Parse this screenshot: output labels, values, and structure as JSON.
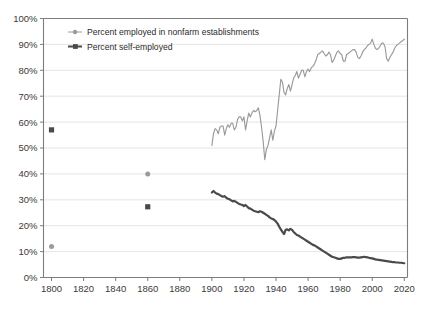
{
  "chart_data": {
    "type": "line",
    "title": "",
    "xlabel": "",
    "ylabel": "",
    "xlim": [
      1795,
      2022
    ],
    "ylim": [
      0,
      100
    ],
    "grid": true,
    "legend_position": "top-left-inside",
    "y_tick_labels": [
      "0%",
      "10%",
      "20%",
      "30%",
      "40%",
      "50%",
      "60%",
      "70%",
      "80%",
      "90%",
      "100%"
    ],
    "y_ticks": [
      0,
      10,
      20,
      30,
      40,
      50,
      60,
      70,
      80,
      90,
      100
    ],
    "x_tick_labels": [
      "1800",
      "1820",
      "1840",
      "1860",
      "1880",
      "1900",
      "1920",
      "1940",
      "1960",
      "1980",
      "2000",
      "2020"
    ],
    "x_ticks": [
      1800,
      1820,
      1840,
      1860,
      1880,
      1900,
      1920,
      1940,
      1960,
      1980,
      2000,
      2020
    ],
    "colors": {
      "nonfarm": "#9a9a9a",
      "self_employed": "#4a4a4a",
      "grid": "#dedede",
      "axis": "#7d7d7d",
      "text": "#3a3a3a"
    },
    "series": [
      {
        "name": "Percent employed in nonfarm establishments",
        "color": "#9a9a9a",
        "marker": "circle",
        "isolated_points": [
          {
            "x": 1800,
            "y": 12.0
          },
          {
            "x": 1860,
            "y": 40.0
          }
        ],
        "x": [
          1900,
          1901,
          1902,
          1903,
          1904,
          1905,
          1906,
          1907,
          1908,
          1909,
          1910,
          1911,
          1912,
          1913,
          1914,
          1915,
          1916,
          1917,
          1918,
          1919,
          1920,
          1921,
          1922,
          1923,
          1924,
          1925,
          1926,
          1927,
          1928,
          1929,
          1930,
          1931,
          1932,
          1933,
          1934,
          1935,
          1936,
          1937,
          1938,
          1939,
          1940,
          1941,
          1942,
          1943,
          1944,
          1945,
          1946,
          1947,
          1948,
          1949,
          1950,
          1951,
          1952,
          1953,
          1954,
          1955,
          1956,
          1957,
          1958,
          1959,
          1960,
          1961,
          1962,
          1963,
          1964,
          1965,
          1966,
          1967,
          1968,
          1969,
          1970,
          1971,
          1972,
          1973,
          1974,
          1975,
          1976,
          1977,
          1978,
          1979,
          1980,
          1981,
          1982,
          1983,
          1984,
          1985,
          1986,
          1987,
          1988,
          1989,
          1990,
          1991,
          1992,
          1993,
          1994,
          1995,
          1996,
          1997,
          1998,
          1999,
          2000,
          2001,
          2002,
          2003,
          2004,
          2005,
          2006,
          2007,
          2008,
          2009,
          2010,
          2011,
          2012,
          2013,
          2014,
          2015,
          2016,
          2017,
          2018,
          2019,
          2020
        ],
        "values": [
          51.0,
          55.5,
          57.5,
          57.0,
          55.5,
          58.0,
          58.5,
          58.5,
          55.0,
          57.5,
          59.0,
          58.0,
          59.5,
          59.5,
          57.0,
          58.0,
          61.0,
          62.0,
          62.0,
          60.5,
          62.0,
          57.0,
          60.5,
          63.5,
          62.0,
          63.5,
          64.5,
          64.0,
          64.5,
          65.5,
          62.5,
          58.0,
          52.5,
          45.5,
          49.5,
          51.0,
          54.0,
          57.0,
          53.0,
          56.5,
          58.5,
          64.5,
          70.5,
          76.5,
          75.5,
          71.5,
          70.5,
          73.0,
          74.5,
          72.0,
          74.5,
          77.0,
          78.0,
          79.5,
          77.0,
          78.5,
          80.0,
          80.0,
          77.5,
          79.5,
          80.5,
          79.5,
          81.0,
          81.5,
          82.5,
          84.0,
          86.0,
          86.5,
          87.0,
          87.5,
          86.5,
          85.5,
          86.0,
          87.0,
          86.0,
          83.0,
          84.0,
          85.5,
          87.0,
          87.5,
          86.5,
          86.0,
          83.5,
          83.5,
          86.0,
          86.5,
          87.0,
          87.5,
          88.0,
          88.0,
          87.0,
          85.0,
          84.5,
          85.5,
          87.0,
          88.0,
          88.5,
          89.5,
          90.0,
          90.5,
          92.0,
          90.0,
          88.5,
          88.0,
          88.5,
          89.5,
          90.5,
          90.5,
          89.0,
          84.5,
          83.5,
          85.0,
          86.0,
          87.0,
          88.5,
          89.5,
          90.0,
          90.5,
          91.0,
          91.5,
          92.0
        ]
      },
      {
        "name": "Percent self-employed",
        "color": "#4a4a4a",
        "marker": "square",
        "isolated_points": [
          {
            "x": 1800,
            "y": 57.0
          },
          {
            "x": 1860,
            "y": 27.3
          }
        ],
        "x": [
          1900,
          1901,
          1902,
          1903,
          1904,
          1905,
          1906,
          1907,
          1908,
          1909,
          1910,
          1911,
          1912,
          1913,
          1914,
          1915,
          1916,
          1917,
          1918,
          1919,
          1920,
          1921,
          1922,
          1923,
          1924,
          1925,
          1926,
          1927,
          1928,
          1929,
          1930,
          1931,
          1932,
          1933,
          1934,
          1935,
          1936,
          1937,
          1938,
          1939,
          1940,
          1941,
          1942,
          1943,
          1944,
          1945,
          1946,
          1947,
          1948,
          1949,
          1950,
          1951,
          1952,
          1953,
          1954,
          1955,
          1956,
          1957,
          1958,
          1959,
          1960,
          1961,
          1962,
          1963,
          1964,
          1965,
          1966,
          1967,
          1968,
          1969,
          1970,
          1971,
          1972,
          1973,
          1974,
          1975,
          1976,
          1977,
          1978,
          1979,
          1980,
          1981,
          1982,
          1983,
          1984,
          1985,
          1986,
          1987,
          1988,
          1989,
          1990,
          1991,
          1992,
          1993,
          1994,
          1995,
          1996,
          1997,
          1998,
          1999,
          2000,
          2001,
          2002,
          2003,
          2004,
          2005,
          2006,
          2007,
          2008,
          2009,
          2010,
          2011,
          2012,
          2013,
          2014,
          2015,
          2016,
          2017,
          2018,
          2019,
          2020
        ],
        "values": [
          32.8,
          33.4,
          32.8,
          32.4,
          32.2,
          31.8,
          31.4,
          31.2,
          31.4,
          30.8,
          30.4,
          30.2,
          29.8,
          29.4,
          29.6,
          29.2,
          28.8,
          28.4,
          28.2,
          28.0,
          27.6,
          28.0,
          27.4,
          26.8,
          26.6,
          26.2,
          25.8,
          25.6,
          25.4,
          25.2,
          25.6,
          25.4,
          25.0,
          24.6,
          24.2,
          23.8,
          23.2,
          22.8,
          22.6,
          22.2,
          21.6,
          20.8,
          19.6,
          18.6,
          17.6,
          16.8,
          18.4,
          18.6,
          18.2,
          18.8,
          18.4,
          17.6,
          17.0,
          16.4,
          16.2,
          15.8,
          15.4,
          15.0,
          14.6,
          14.2,
          13.8,
          13.4,
          13.0,
          12.6,
          12.4,
          12.0,
          11.6,
          11.2,
          10.8,
          10.4,
          10.0,
          9.6,
          9.2,
          8.8,
          8.4,
          8.0,
          7.8,
          7.6,
          7.4,
          7.2,
          7.2,
          7.4,
          7.6,
          7.6,
          7.8,
          7.8,
          7.8,
          7.8,
          7.9,
          7.9,
          7.8,
          7.7,
          7.7,
          7.8,
          7.9,
          8.0,
          7.9,
          7.8,
          7.6,
          7.5,
          7.4,
          7.2,
          7.0,
          6.9,
          6.8,
          6.7,
          6.6,
          6.5,
          6.4,
          6.3,
          6.2,
          6.1,
          6.0,
          5.9,
          5.9,
          5.8,
          5.8,
          5.7,
          5.7,
          5.6,
          5.5
        ]
      }
    ],
    "legend": [
      {
        "label": "Percent employed in nonfarm establishments",
        "color": "#9a9a9a",
        "marker": "circle"
      },
      {
        "label": "Percent self-employed",
        "color": "#4a4a4a",
        "marker": "square"
      }
    ]
  }
}
